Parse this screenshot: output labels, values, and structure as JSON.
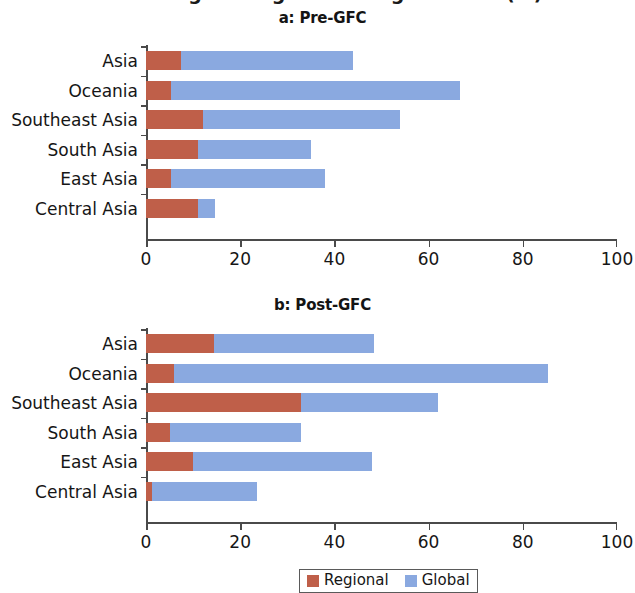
{
  "figure": {
    "cropped_super_title": "Percentage of regional and global FDI (%)",
    "axis_color": "#4a4a4a",
    "background": "#ffffff"
  },
  "legend": {
    "position": "bottom-center",
    "items": [
      {
        "label": "Regional",
        "color": "#bf5f49",
        "swatch_name": "legend-swatch-regional"
      },
      {
        "label": "Global",
        "color": "#8aa9e0",
        "swatch_name": "legend-swatch-global"
      }
    ]
  },
  "chart_data": [
    {
      "type": "bar",
      "orientation": "horizontal",
      "stacked": true,
      "title": "a: Pre-GFC",
      "xlabel": "",
      "ylabel": "",
      "xlim": [
        0,
        100
      ],
      "xticks": [
        0,
        20,
        40,
        60,
        80,
        100
      ],
      "xtick_labels": [
        "0",
        "20",
        "40",
        "60",
        "80",
        "100"
      ],
      "grid": false,
      "categories": [
        "Asia",
        "Oceania",
        "Southeast Asia",
        "South Asia",
        "East Asia",
        "Central Asia"
      ],
      "series": [
        {
          "name": "Regional",
          "color": "#bf5f49",
          "values": [
            7.5,
            5.4,
            12.0,
            11.0,
            5.4,
            11.0
          ]
        },
        {
          "name": "Global",
          "color": "#8aa9e0",
          "values": [
            36.5,
            61.2,
            42.0,
            24.0,
            32.6,
            3.6
          ]
        }
      ],
      "totals": [
        44.0,
        66.6,
        54.0,
        35.0,
        38.0,
        14.6
      ]
    },
    {
      "type": "bar",
      "orientation": "horizontal",
      "stacked": true,
      "title": "b: Post-GFC",
      "xlabel": "",
      "ylabel": "",
      "xlim": [
        0,
        100
      ],
      "xticks": [
        0,
        20,
        40,
        60,
        80,
        100
      ],
      "xtick_labels": [
        "0",
        "20",
        "40",
        "60",
        "80",
        "100"
      ],
      "grid": false,
      "categories": [
        "Asia",
        "Oceania",
        "Southeast Asia",
        "South Asia",
        "East Asia",
        "Central Asia"
      ],
      "series": [
        {
          "name": "Regional",
          "color": "#bf5f49",
          "values": [
            14.4,
            6.0,
            33.0,
            5.0,
            10.0,
            1.2
          ]
        },
        {
          "name": "Global",
          "color": "#8aa9e0",
          "values": [
            34.1,
            79.4,
            29.0,
            28.0,
            38.0,
            22.3
          ]
        }
      ],
      "totals": [
        48.5,
        85.4,
        62.0,
        33.0,
        48.0,
        23.5
      ]
    }
  ]
}
